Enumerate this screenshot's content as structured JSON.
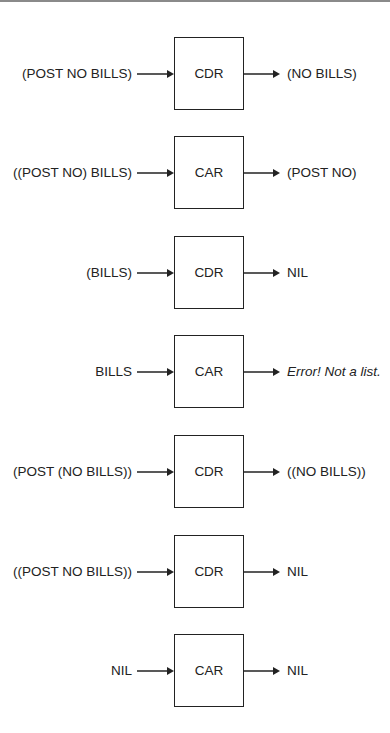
{
  "diagram": {
    "rows": [
      {
        "input": "(POST NO BILLS)",
        "function": "CDR",
        "output": "(NO BILLS)",
        "output_italic": false
      },
      {
        "input": "((POST NO) BILLS)",
        "function": "CAR",
        "output": "(POST NO)",
        "output_italic": false
      },
      {
        "input": "(BILLS)",
        "function": "CDR",
        "output": "NIL",
        "output_italic": false
      },
      {
        "input": "BILLS",
        "function": "CAR",
        "output": "Error! Not a list.",
        "output_italic": true
      },
      {
        "input": "(POST (NO BILLS))",
        "function": "CDR",
        "output": "((NO BILLS))",
        "output_italic": false
      },
      {
        "input": "((POST NO BILLS))",
        "function": "CDR",
        "output": "NIL",
        "output_italic": false
      },
      {
        "input": "NIL",
        "function": "CAR",
        "output": "NIL",
        "output_italic": false
      }
    ],
    "colors": {
      "line": "#222222",
      "text": "#222222",
      "background": "#ffffff"
    }
  }
}
